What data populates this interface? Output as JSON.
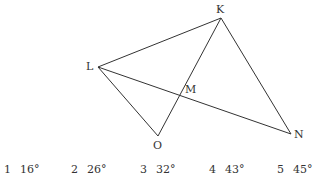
{
  "figure": {
    "points": {
      "K": {
        "label": "K",
        "x": 221,
        "y": 18
      },
      "L": {
        "label": "L",
        "x": 98,
        "y": 67
      },
      "M": {
        "label": "M",
        "x": 180,
        "y": 92
      },
      "N": {
        "label": "N",
        "x": 291,
        "y": 134
      },
      "O": {
        "label": "O",
        "x": 158,
        "y": 136
      }
    },
    "segments": [
      [
        "L",
        "K"
      ],
      [
        "K",
        "N"
      ],
      [
        "L",
        "N"
      ],
      [
        "L",
        "O"
      ],
      [
        "O",
        "K"
      ]
    ],
    "line_color": "#333333"
  },
  "choices": [
    {
      "num": "1",
      "value": "16°"
    },
    {
      "num": "2",
      "value": "26°"
    },
    {
      "num": "3",
      "value": "32°"
    },
    {
      "num": "4",
      "value": "43°"
    },
    {
      "num": "5",
      "value": "45°"
    }
  ]
}
